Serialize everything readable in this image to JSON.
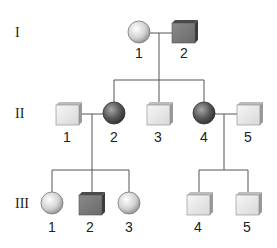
{
  "colors": {
    "affected": "#6e6e6e",
    "unaffected": "#e6e6e6",
    "line": "#555555"
  },
  "generations": [
    {
      "label": "I",
      "individuals": [
        {
          "id": "1",
          "sex": "female",
          "affected": false
        },
        {
          "id": "2",
          "sex": "male",
          "affected": true
        }
      ]
    },
    {
      "label": "II",
      "individuals": [
        {
          "id": "1",
          "sex": "male",
          "affected": false
        },
        {
          "id": "2",
          "sex": "female",
          "affected": true
        },
        {
          "id": "3",
          "sex": "male",
          "affected": false
        },
        {
          "id": "4",
          "sex": "female",
          "affected": true
        },
        {
          "id": "5",
          "sex": "male",
          "affected": false
        }
      ]
    },
    {
      "label": "III",
      "individuals": [
        {
          "id": "1",
          "sex": "female",
          "affected": false
        },
        {
          "id": "2",
          "sex": "male",
          "affected": true
        },
        {
          "id": "3",
          "sex": "female",
          "affected": false
        },
        {
          "id": "4",
          "sex": "male",
          "affected": false
        },
        {
          "id": "5",
          "sex": "male",
          "affected": false
        }
      ]
    }
  ]
}
